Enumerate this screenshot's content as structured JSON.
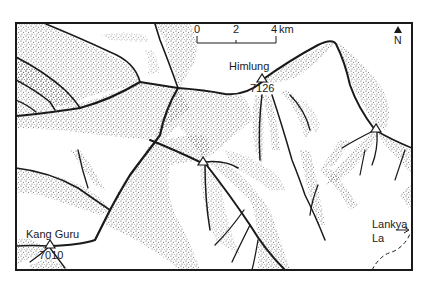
{
  "map": {
    "frame": {
      "x": 16,
      "y": 23,
      "width": 396,
      "height": 247
    },
    "colors": {
      "ink": "#1a1a1a",
      "stipple": "#555555",
      "background": "#ffffff"
    },
    "scale_bar": {
      "ticks": [
        "0",
        "2",
        "4"
      ],
      "unit": "km"
    },
    "north_arrow": {
      "label": "N",
      "icon": "north-arrow-icon"
    },
    "peaks": [
      {
        "name": "Himlung",
        "elevation": "7126"
      },
      {
        "name": "Kang Guru",
        "elevation": "7010"
      }
    ],
    "passes": [
      {
        "name_line1": "Lankya",
        "name_line2": "La"
      }
    ]
  }
}
